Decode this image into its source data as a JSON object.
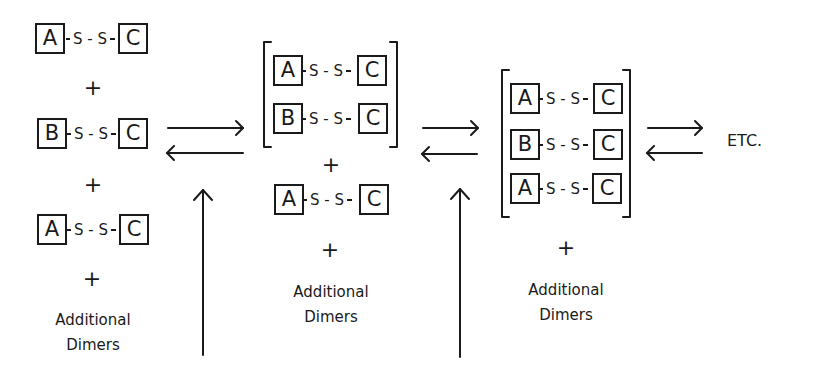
{
  "diagram": {
    "stage1": {
      "dimers": [
        {
          "left": "A",
          "link": "S - S",
          "right": "C"
        },
        {
          "left": "B",
          "link": "S - S",
          "right": "C"
        },
        {
          "left": "A",
          "link": "S - S",
          "right": "C"
        }
      ],
      "plus": "+",
      "additional": [
        "Additional",
        "Dimers"
      ]
    },
    "stage2": {
      "complex": [
        {
          "left": "A",
          "link": "S - S",
          "right": "C"
        },
        {
          "left": "B",
          "link": "S - S",
          "right": "C"
        }
      ],
      "plus": "+",
      "free_dimer": {
        "left": "A",
        "link": "S - S",
        "right": "C"
      },
      "additional": [
        "Additional",
        "Dimers"
      ]
    },
    "stage3": {
      "complex": [
        {
          "left": "A",
          "link": "S - S",
          "right": "C"
        },
        {
          "left": "B",
          "link": "S - S",
          "right": "C"
        },
        {
          "left": "A",
          "link": "S - S",
          "right": "C"
        }
      ],
      "plus": "+",
      "additional": [
        "Additional",
        "Dimers"
      ]
    },
    "equilibrium_arrows": [
      "forward",
      "reverse"
    ],
    "continuation": "ETC."
  }
}
